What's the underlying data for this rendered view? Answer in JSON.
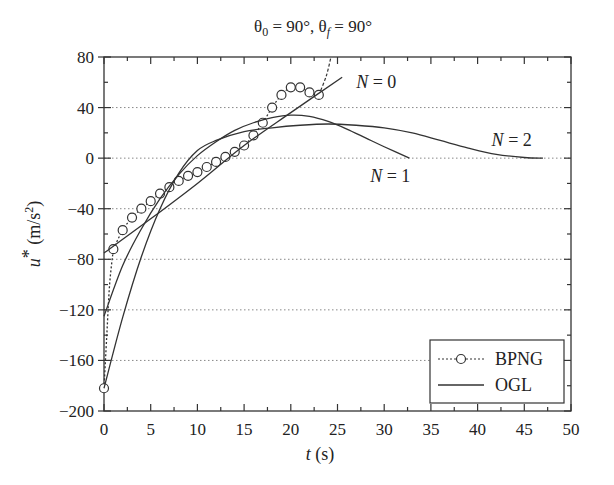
{
  "chart_data": {
    "type": "line",
    "title": "θ0 = 90°, θf = 90°",
    "title_parts": {
      "theta0": "θ",
      "sub0": "0",
      "eq0": " = 90°, ",
      "thetaf": "θ",
      "subf": "f",
      "eqf": " = 90°"
    },
    "xlabel": "t (s)",
    "xlabel_parts": {
      "var": "t",
      "unit": " (s)"
    },
    "ylabel": "u* (m/s²)",
    "ylabel_parts": {
      "var": "u",
      "star": "*",
      "unit": " (m/s",
      "sup": "2",
      "close": ")"
    },
    "xlim": [
      0,
      50
    ],
    "ylim": [
      -200,
      80
    ],
    "xticks": [
      0,
      5,
      10,
      15,
      20,
      25,
      30,
      35,
      40,
      45,
      50
    ],
    "yticks": [
      80,
      40,
      0,
      -40,
      -80,
      -120,
      -160,
      -200
    ],
    "ytick_labels": [
      "80",
      "40",
      "0",
      "−40",
      "−80",
      "−120",
      "−160",
      "−200"
    ],
    "grid": {
      "horizontal_dotted": [
        40,
        0,
        -40,
        -80,
        -120,
        -160
      ]
    },
    "legend": {
      "position": "lower right",
      "entries": [
        {
          "label": "BPNG",
          "style": "dotted line with open circle markers"
        },
        {
          "label": "OGL",
          "style": "solid line"
        }
      ]
    },
    "annotations": [
      {
        "text": "N = 0",
        "var": "N",
        "rest": " = 0",
        "x": 27,
        "y": 60
      },
      {
        "text": "N = 1",
        "var": "N",
        "rest": " = 1",
        "x": 28.5,
        "y": -14
      },
      {
        "text": "N = 2",
        "var": "N",
        "rest": " = 2",
        "x": 41.5,
        "y": 14
      }
    ],
    "series": [
      {
        "name": "BPNG",
        "style": "dotted",
        "markers": "open-circle",
        "x": [
          0,
          1,
          2,
          3,
          4,
          5,
          6,
          7,
          8,
          9,
          10,
          11,
          12,
          13,
          14,
          15,
          16,
          17,
          18,
          19,
          20,
          21,
          22,
          23
        ],
        "y": [
          -182,
          -72,
          -57,
          -47,
          -40,
          -34,
          -28,
          -23,
          -18,
          -14,
          -11,
          -7,
          -3,
          1,
          5,
          10,
          18,
          28,
          40,
          50,
          56,
          56,
          52,
          50
        ],
        "tail": {
          "x": [
            0,
            0.3,
            0.6,
            1
          ],
          "y": [
            -182,
            -140,
            -100,
            -72
          ]
        },
        "end_spike": {
          "x": [
            23,
            23.8,
            24.3
          ],
          "y": [
            50,
            65,
            80
          ]
        }
      },
      {
        "name": "OGL N = 0",
        "style": "solid",
        "x": [
          0,
          5,
          10,
          15,
          20,
          25.5
        ],
        "y": [
          -75,
          -48,
          -20,
          10,
          36,
          64
        ]
      },
      {
        "name": "OGL N = 1",
        "style": "solid",
        "x": [
          0,
          2,
          4,
          6,
          8,
          10,
          12,
          14,
          16,
          18,
          20,
          22,
          24,
          26,
          28,
          30,
          32.7
        ],
        "y": [
          -125,
          -85,
          -56,
          -32,
          -13,
          2,
          13,
          22,
          28,
          32,
          34,
          33,
          29,
          23,
          16,
          9,
          0
        ]
      },
      {
        "name": "OGL N = 2",
        "style": "solid",
        "x": [
          0,
          2,
          4,
          6,
          8,
          10,
          12,
          15,
          18,
          21,
          24,
          27,
          30,
          33,
          36,
          39,
          42,
          45,
          47
        ],
        "y": [
          -182,
          -126,
          -78,
          -40,
          -12,
          6,
          14,
          21,
          24,
          26,
          27,
          26,
          24,
          20,
          14,
          8,
          3,
          0.5,
          0
        ]
      }
    ]
  }
}
